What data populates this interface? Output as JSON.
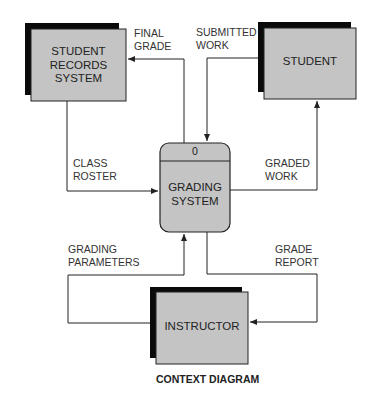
{
  "diagram": {
    "type": "data-flow-diagram",
    "caption": "CONTEXT DIAGRAM",
    "colors": {
      "entity_fill": "#c4c4c4",
      "shadow": "#0a0a0a",
      "stroke": "#222222",
      "process_fill": "#c4c4c4"
    },
    "process": {
      "number": "0",
      "name_line1": "GRADING",
      "name_line2": "SYSTEM"
    },
    "entities": {
      "student_records": {
        "line1": "STUDENT",
        "line2": "RECORDS",
        "line3": "SYSTEM"
      },
      "student": {
        "label": "STUDENT"
      },
      "instructor": {
        "label": "INSTRUCTOR"
      }
    },
    "flows": {
      "final_grade": {
        "line1": "FINAL",
        "line2": "GRADE",
        "from": "GRADING SYSTEM",
        "to": "STUDENT RECORDS SYSTEM"
      },
      "submitted_work": {
        "line1": "SUBMITTED",
        "line2": "WORK",
        "from": "STUDENT",
        "to": "GRADING SYSTEM"
      },
      "class_roster": {
        "line1": "CLASS",
        "line2": "ROSTER",
        "from": "STUDENT RECORDS SYSTEM",
        "to": "GRADING SYSTEM"
      },
      "graded_work": {
        "line1": "GRADED",
        "line2": "WORK",
        "from": "GRADING SYSTEM",
        "to": "STUDENT"
      },
      "grading_parameters": {
        "line1": "GRADING",
        "line2": "PARAMETERS",
        "from": "INSTRUCTOR",
        "to": "GRADING SYSTEM"
      },
      "grade_report": {
        "line1": "GRADE",
        "line2": "REPORT",
        "from": "GRADING SYSTEM",
        "to": "INSTRUCTOR"
      }
    }
  }
}
